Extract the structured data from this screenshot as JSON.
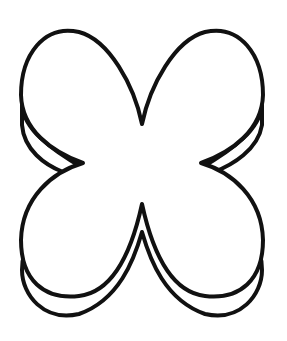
{
  "figure": {
    "subject": "four-petal flower outline with offset depth line",
    "stroke_color": "#111111",
    "fill_color": "#ffffff",
    "background": "#ffffff",
    "stroke_width": 4
  }
}
